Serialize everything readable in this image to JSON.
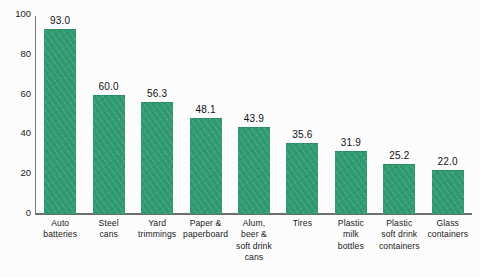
{
  "chart_data": {
    "type": "bar",
    "title": "",
    "subtitle": "",
    "xlabel": "",
    "ylabel": "",
    "ylim": [
      0,
      100
    ],
    "yticks": [
      0,
      20,
      40,
      60,
      80,
      100
    ],
    "grid": false,
    "legend": null,
    "bar_color": "#309a70",
    "categories": [
      "Auto batteries",
      "Steel cans",
      "Yard trimmings",
      "Paper & paperboard",
      "Alum, beer & soft drink cans",
      "Tires",
      "Plastic milk bottles",
      "Plastic soft drink containers",
      "Glass containers"
    ],
    "category_lines": [
      [
        "Auto",
        "batteries"
      ],
      [
        "Steel",
        "cans"
      ],
      [
        "Yard",
        "trimmings"
      ],
      [
        "Paper &",
        "paperboard"
      ],
      [
        "Alum,",
        "beer &",
        "soft drink",
        "cans"
      ],
      [
        "Tires"
      ],
      [
        "Plastic",
        "milk",
        "bottles"
      ],
      [
        "Plastic",
        "soft drink",
        "containers"
      ],
      [
        "Glass",
        "containers"
      ]
    ],
    "values": [
      93.0,
      60.0,
      56.3,
      48.1,
      43.9,
      35.6,
      31.9,
      25.2,
      22.0
    ],
    "value_labels": [
      "93.0",
      "60.0",
      "56.3",
      "48.1",
      "43.9",
      "35.6",
      "31.9",
      "25.2",
      "22.0"
    ]
  }
}
